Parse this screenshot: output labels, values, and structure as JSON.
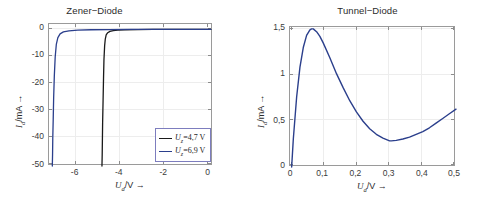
{
  "figure": {
    "background": "#ffffff",
    "panels": [
      "zener",
      "tunnel"
    ]
  },
  "zener": {
    "title": "Zener−Diode",
    "xlabel_main": "U",
    "xlabel_sub": "d",
    "xlabel_unit": "/V →",
    "ylabel_main": "I",
    "ylabel_sub": "d",
    "ylabel_unit": "/mA →",
    "xticks": [
      "-6",
      "-4",
      "-2",
      "0"
    ],
    "yticks": [
      "0",
      "-10",
      "-20",
      "-30",
      "-40",
      "-50"
    ],
    "legend": {
      "items": [
        {
          "label_main": "U",
          "label_sub": "z",
          "label_rest": "=4,7 V",
          "color": "#1a1a1a"
        },
        {
          "label_main": "U",
          "label_sub": "z",
          "label_rest": "=6,9 V",
          "color": "#2b3f8c"
        }
      ]
    }
  },
  "tunnel": {
    "title": "Tunnel−Diode",
    "xlabel_main": "U",
    "xlabel_sub": "d",
    "xlabel_unit": "/V →",
    "ylabel_main": "I",
    "ylabel_sub": "d",
    "ylabel_unit": "/mA →",
    "xticks": [
      "0",
      "0,1",
      "0,2",
      "0,3",
      "0,4",
      "0,5"
    ],
    "yticks": [
      "0",
      "0,5",
      "1",
      "1,5"
    ]
  },
  "chart_data": [
    {
      "type": "line",
      "id": "zener-diode",
      "title": "Zener−Diode",
      "xlabel": "U_d/V →",
      "ylabel": "I_d/mA →",
      "xlim": [
        -7.2,
        0.2
      ],
      "ylim": [
        -50,
        2
      ],
      "xticks": [
        -6,
        -4,
        -2,
        0
      ],
      "yticks": [
        0,
        -10,
        -20,
        -30,
        -40,
        -50
      ],
      "grid": true,
      "legend_position": "lower right",
      "series": [
        {
          "name": "U_z=4,7 V",
          "color": "#1a1a1a",
          "breakdown_voltage_V": 4.7,
          "x": [
            0.1,
            -0.5,
            -1.5,
            -2.5,
            -3.2,
            -3.8,
            -4.1,
            -4.3,
            -4.45,
            -4.55,
            -4.62,
            -4.66,
            -4.69,
            -4.72,
            -4.74,
            -4.76,
            -4.78,
            -4.79,
            -4.8,
            -4.81
          ],
          "y": [
            0,
            0,
            0,
            0,
            -0.05,
            -0.1,
            -0.2,
            -0.4,
            -0.7,
            -1.2,
            -2.0,
            -3.5,
            -6.0,
            -11,
            -18,
            -26,
            -34,
            -40,
            -46,
            -50
          ]
        },
        {
          "name": "U_z=6,9 V",
          "color": "#2b3f8c",
          "breakdown_voltage_V": 6.9,
          "x": [
            0.1,
            -0.5,
            -1.5,
            -2.5,
            -3.5,
            -4.5,
            -5.3,
            -5.9,
            -6.3,
            -6.55,
            -6.7,
            -6.8,
            -6.87,
            -6.92,
            -6.96,
            -6.99,
            -7.01,
            -7.03,
            -7.04,
            -7.05
          ],
          "y": [
            0,
            0,
            0,
            0,
            0,
            -0.05,
            -0.1,
            -0.25,
            -0.5,
            -0.9,
            -1.6,
            -3.0,
            -5.5,
            -10,
            -17,
            -25,
            -33,
            -40,
            -46,
            -50
          ]
        }
      ]
    },
    {
      "type": "line",
      "id": "tunnel-diode",
      "title": "Tunnel−Diode",
      "xlabel": "U_d/V →",
      "ylabel": "I_d/mA →",
      "xlim": [
        0,
        0.5
      ],
      "ylim": [
        0,
        1.5
      ],
      "xticks": [
        0,
        0.1,
        0.2,
        0.3,
        0.4,
        0.5
      ],
      "yticks": [
        0,
        0.5,
        1,
        1.5
      ],
      "grid": true,
      "legend_position": "none",
      "series": [
        {
          "name": "Tunnel diode characteristic",
          "color": "#2b3f8c",
          "peak_current_mA": 1.48,
          "peak_voltage_V": 0.065,
          "valley_current_mA": 0.28,
          "valley_voltage_V": 0.305,
          "x": [
            0.005,
            0.01,
            0.02,
            0.03,
            0.04,
            0.05,
            0.06,
            0.065,
            0.07,
            0.08,
            0.09,
            0.1,
            0.12,
            0.14,
            0.16,
            0.18,
            0.2,
            0.22,
            0.24,
            0.26,
            0.28,
            0.3,
            0.305,
            0.32,
            0.34,
            0.36,
            0.38,
            0.4,
            0.42,
            0.44,
            0.46,
            0.48,
            0.5
          ],
          "y": [
            0.0,
            0.3,
            0.75,
            1.07,
            1.28,
            1.41,
            1.47,
            1.48,
            1.48,
            1.45,
            1.4,
            1.33,
            1.17,
            1.0,
            0.85,
            0.71,
            0.59,
            0.49,
            0.41,
            0.35,
            0.31,
            0.28,
            0.28,
            0.285,
            0.3,
            0.32,
            0.35,
            0.38,
            0.42,
            0.47,
            0.52,
            0.57,
            0.62
          ]
        }
      ]
    }
  ]
}
